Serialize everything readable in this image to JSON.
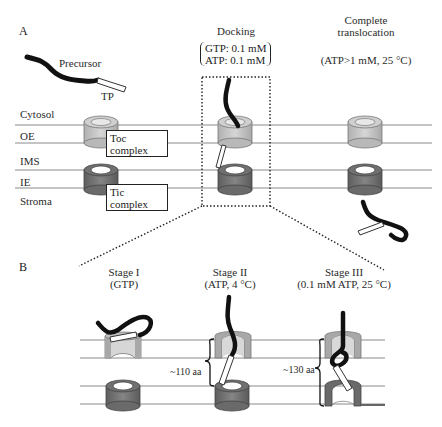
{
  "panel_a": {
    "label": "A",
    "precursor_label": "Precursor",
    "tp_label": "TP",
    "compartments": [
      "Cytosol",
      "OE",
      "IMS",
      "IE",
      "Stroma"
    ],
    "toc_box": {
      "line1": "Toc",
      "line2": "complex"
    },
    "tic_box": {
      "line1": "Tic",
      "line2": "complex"
    },
    "docking": {
      "title": "Docking",
      "condition1": "GTP: 0.1 mM",
      "condition2": "ATP: 0.1 mM"
    },
    "complete": {
      "title_line1": "Complete",
      "title_line2": "translocation",
      "condition": "(ATP>1 mM, 25 °C)"
    }
  },
  "panel_b": {
    "label": "B",
    "stages": [
      {
        "title": "Stage I",
        "condition": "(GTP)"
      },
      {
        "title": "Stage II",
        "condition": "(ATP, 4 °C)"
      },
      {
        "title": "Stage III",
        "condition": "(0.1 mM ATP, 25 °C)"
      }
    ],
    "span_labels": [
      "~110 aa",
      "~130 aa"
    ]
  },
  "colors": {
    "toc_light": "#c8c8c8",
    "toc_inner": "#e6e6e6",
    "tic_dark": "#7a7a7a",
    "membrane_line": "#888888",
    "precursor": "#111111"
  }
}
